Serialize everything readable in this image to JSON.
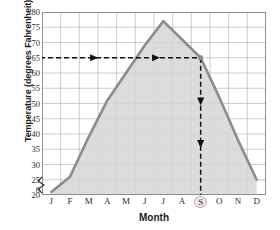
{
  "chart_data": {
    "type": "line",
    "title": "",
    "xlabel": "Month",
    "ylabel": "Temperature (degrees Fahrenheit)",
    "categories": [
      "J",
      "F",
      "M",
      "A",
      "M",
      "J",
      "J",
      "A",
      "S",
      "O",
      "N",
      "D"
    ],
    "category_names": [
      "January",
      "February",
      "March",
      "April",
      "May",
      "June",
      "July",
      "August",
      "September",
      "October",
      "November",
      "December"
    ],
    "values": [
      21,
      26,
      39,
      51,
      60,
      69,
      77,
      71,
      65,
      52,
      38,
      25
    ],
    "ylim": [
      20,
      80
    ],
    "ytick_values": [
      80,
      75,
      70,
      65,
      60,
      55,
      50,
      45,
      40,
      35,
      30,
      25,
      20,
      0
    ],
    "ytick_labels": [
      "80",
      "75",
      "70",
      "65",
      "60",
      "55",
      "50",
      "45",
      "40",
      "35",
      "30",
      "25",
      "20",
      "0"
    ],
    "axis_break": true,
    "grid": true,
    "legend": "none",
    "area_fill": true,
    "series_name": "Average monthly temperature",
    "annotations": [
      {
        "name": "horizontal-guide",
        "orientation": "horizontal",
        "value": 65,
        "from_category": "J",
        "to_category": "S",
        "style": "dashed",
        "arrowheads": 2,
        "label": "65"
      },
      {
        "name": "vertical-guide",
        "orientation": "vertical",
        "category": "S",
        "from_value": 65,
        "to_value": 0,
        "style": "dashed",
        "arrowheads": 2,
        "label": "S"
      }
    ],
    "highlight_category": "S",
    "highlight_value": 65
  },
  "colors": {
    "line": "#8c8c8c",
    "fill": "#d6d6d6",
    "grid": "#b8b8b8",
    "frame": "#8f8f8f",
    "guide": "#111111",
    "text": "#1a1a1a",
    "highlight_ring": "#c9a9a9",
    "background": "#ffffff"
  }
}
